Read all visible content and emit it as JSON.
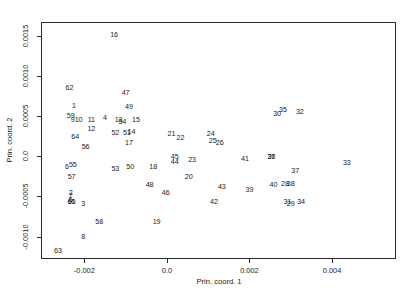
{
  "chart_data": {
    "type": "scatter",
    "title": "",
    "xlabel": "Prin. coord. 1",
    "ylabel": "Prin. coord. 2",
    "xlim": [
      -0.00305,
      0.00555
    ],
    "ylim": [
      -0.00128,
      0.00167
    ],
    "xticks": [
      -0.002,
      0.0,
      0.002,
      0.004
    ],
    "xticklabels": [
      "-0.002",
      "0.0",
      "0.002",
      "0.004"
    ],
    "yticks": [
      -0.001,
      -0.0005,
      0.0,
      0.0005,
      0.001,
      0.0015
    ],
    "yticklabels": [
      "-0.0010",
      "-0.0005",
      "0.0",
      "0.0005",
      "0.0010",
      "0.0015"
    ],
    "grid": false,
    "legend": null,
    "marker_style": "text-label",
    "point_count": 64,
    "points": [
      {
        "label": "1",
        "x": -0.00225,
        "y": 0.00063
      },
      {
        "label": "2",
        "x": -0.00233,
        "y": -0.00046
      },
      {
        "label": "3",
        "x": -0.00203,
        "y": -0.0006
      },
      {
        "label": "4",
        "x": -0.0015,
        "y": 0.00047
      },
      {
        "label": "5",
        "x": -0.00233,
        "y": -0.00055
      },
      {
        "label": "6",
        "x": -0.00242,
        "y": -0.00013
      },
      {
        "label": "7",
        "x": -0.00233,
        "y": -0.0005
      },
      {
        "label": "8",
        "x": -0.00203,
        "y": -0.00101
      },
      {
        "label": "9",
        "x": -0.00228,
        "y": 0.00045
      },
      {
        "label": "10",
        "x": -0.00214,
        "y": 0.00045
      },
      {
        "label": "11",
        "x": -0.00183,
        "y": 0.00045
      },
      {
        "label": "12",
        "x": -0.00183,
        "y": 0.00034
      },
      {
        "label": "13",
        "x": -0.00117,
        "y": 0.00045
      },
      {
        "label": "14",
        "x": -0.00086,
        "y": 0.0003
      },
      {
        "label": "15",
        "x": -0.00075,
        "y": 0.00045
      },
      {
        "label": "16",
        "x": -0.00128,
        "y": 0.00151
      },
      {
        "label": "17",
        "x": -0.00092,
        "y": 0.00016
      },
      {
        "label": "18",
        "x": -0.00033,
        "y": -0.00014
      },
      {
        "label": "19",
        "x": -0.00025,
        "y": -0.00082
      },
      {
        "label": "20",
        "x": 0.00053,
        "y": -0.00026
      },
      {
        "label": "21",
        "x": 0.00011,
        "y": 0.00028
      },
      {
        "label": "22",
        "x": 0.00033,
        "y": 0.00022
      },
      {
        "label": "23",
        "x": 0.00061,
        "y": -5e-05
      },
      {
        "label": "24",
        "x": 0.00106,
        "y": 0.00028
      },
      {
        "label": "25",
        "x": 0.00111,
        "y": 0.00019
      },
      {
        "label": "26",
        "x": 0.00128,
        "y": 0.00017
      },
      {
        "label": "27",
        "x": 0.00253,
        "y": -1e-05
      },
      {
        "label": "28",
        "x": 0.00286,
        "y": -0.00035
      },
      {
        "label": "29",
        "x": 0.003,
        "y": -0.0006
      },
      {
        "label": "30",
        "x": 0.00267,
        "y": 0.00053
      },
      {
        "label": "31",
        "x": 0.00292,
        "y": -0.00057
      },
      {
        "label": "32",
        "x": 0.00322,
        "y": 0.00055
      },
      {
        "label": "33",
        "x": 0.00436,
        "y": -8e-05
      },
      {
        "label": "34",
        "x": 0.00325,
        "y": -0.00057
      },
      {
        "label": "35",
        "x": 0.00281,
        "y": 0.00057
      },
      {
        "label": "36",
        "x": 0.00253,
        "y": -1e-05
      },
      {
        "label": "37",
        "x": 0.00311,
        "y": -0.00018
      },
      {
        "label": "38",
        "x": 0.003,
        "y": -0.00035
      },
      {
        "label": "39",
        "x": 0.002,
        "y": -0.00042
      },
      {
        "label": "40",
        "x": 0.00258,
        "y": -0.00036
      },
      {
        "label": "41",
        "x": 0.00189,
        "y": -3e-05
      },
      {
        "label": "42",
        "x": 0.00114,
        "y": -0.00057
      },
      {
        "label": "43",
        "x": 0.00133,
        "y": -0.00039
      },
      {
        "label": "44",
        "x": 0.00019,
        "y": -7e-05
      },
      {
        "label": "45",
        "x": 0.00019,
        "y": -1e-05
      },
      {
        "label": "46",
        "x": -3e-05,
        "y": -0.00046
      },
      {
        "label": "47",
        "x": -0.001,
        "y": 0.00079
      },
      {
        "label": "48",
        "x": -0.00042,
        "y": -0.00036
      },
      {
        "label": "49",
        "x": -0.00092,
        "y": 0.00061
      },
      {
        "label": "50",
        "x": -0.00089,
        "y": -0.00013
      },
      {
        "label": "51",
        "x": -0.00097,
        "y": 0.00029
      },
      {
        "label": "52",
        "x": -0.00125,
        "y": 0.00029
      },
      {
        "label": "53",
        "x": -0.00125,
        "y": -0.00016
      },
      {
        "label": "54",
        "x": -0.00108,
        "y": 0.00042
      },
      {
        "label": "55",
        "x": -0.00228,
        "y": -0.00011
      },
      {
        "label": "56",
        "x": -0.00197,
        "y": 0.00011
      },
      {
        "label": "57",
        "x": -0.00231,
        "y": -0.00026
      },
      {
        "label": "58",
        "x": -0.00164,
        "y": -0.00082
      },
      {
        "label": "59",
        "x": -0.00233,
        "y": 0.0005
      },
      {
        "label": "60",
        "x": -0.00231,
        "y": -0.00057
      },
      {
        "label": "61",
        "x": -0.00231,
        "y": -0.00057
      },
      {
        "label": "62",
        "x": -0.00236,
        "y": 0.00085
      },
      {
        "label": "63",
        "x": -0.00264,
        "y": -0.00118
      },
      {
        "label": "64",
        "x": -0.00222,
        "y": 0.00024
      }
    ]
  },
  "axes": {
    "x_title": "Prin. coord. 1",
    "y_title": "Prin. coord. 2"
  }
}
